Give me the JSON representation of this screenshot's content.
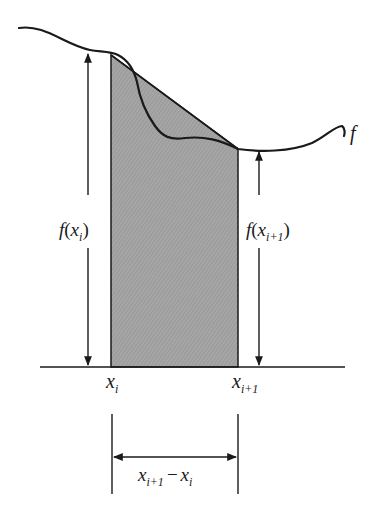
{
  "diagram": {
    "curve_label": "f",
    "left_height_label": {
      "fn": "f",
      "open": "(",
      "var": "x",
      "sub": "i",
      "close": ")"
    },
    "right_height_label": {
      "fn": "f",
      "open": "(",
      "var": "x",
      "sub": "i+1",
      "close": ")"
    },
    "x_left_label": {
      "var": "x",
      "sub": "i"
    },
    "x_right_label": {
      "var": "x",
      "sub": "i+1"
    },
    "width_label": {
      "var1": "x",
      "sub1": "i+1",
      "minus": "−",
      "var2": "x",
      "sub2": "i"
    },
    "colors": {
      "ink": "#1a1a1a",
      "shade": "#a9a9a9",
      "background": "#ffffff"
    }
  }
}
